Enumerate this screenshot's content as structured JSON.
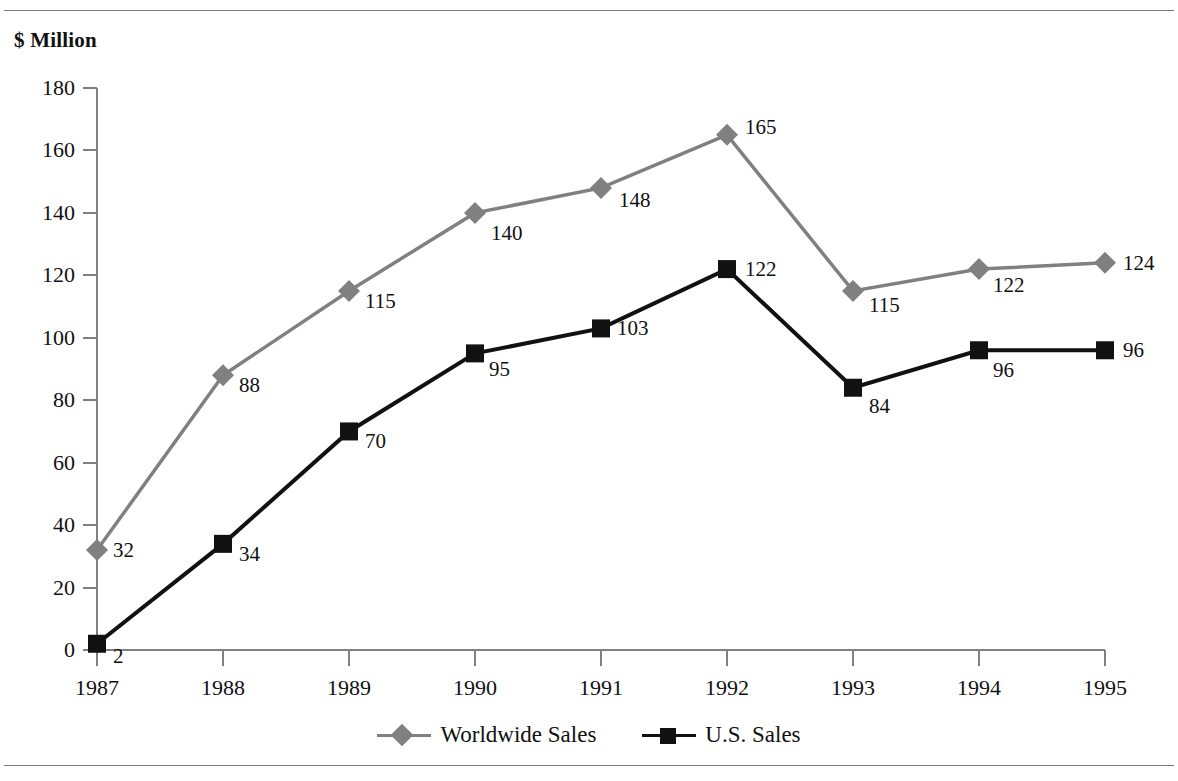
{
  "chart_data": {
    "type": "line",
    "title": "",
    "xlabel": "",
    "ylabel": "$ Million",
    "ylim": [
      0,
      180
    ],
    "ytick_labels": [
      "0",
      "20",
      "40",
      "60",
      "80",
      "100",
      "120",
      "140",
      "160",
      "180"
    ],
    "ytick_values": [
      0,
      20,
      40,
      60,
      80,
      100,
      120,
      140,
      160,
      180
    ],
    "grid": false,
    "legend_position": "bottom-center",
    "categories": [
      "1987",
      "1988",
      "1989",
      "1990",
      "1991",
      "1992",
      "1993",
      "1994",
      "1995"
    ],
    "series": [
      {
        "name": "Worldwide Sales",
        "values": [
          32,
          88,
          115,
          140,
          148,
          165,
          115,
          122,
          124
        ],
        "color": "#808080",
        "marker": "diamond"
      },
      {
        "name": "U.S. Sales",
        "values": [
          2,
          34,
          70,
          95,
          103,
          122,
          84,
          96,
          96
        ],
        "color": "#111111",
        "marker": "square"
      }
    ],
    "point_labels": {
      "Worldwide Sales": [
        "32",
        "88",
        "115",
        "140",
        "148",
        "165",
        "115",
        "122",
        "124"
      ],
      "U.S. Sales": [
        "2",
        "34",
        "70",
        "95",
        "103",
        "122",
        "84",
        "96",
        "96"
      ]
    }
  },
  "axis": {
    "unit_label": "$ Million"
  },
  "legend": {
    "entries": [
      {
        "label": "Worldwide Sales",
        "marker_name": "diamond-marker-icon"
      },
      {
        "label": "U.S. Sales",
        "marker_name": "square-marker-icon"
      }
    ]
  },
  "colors": {
    "worldwide": "#808080",
    "us": "#111111",
    "axis": "#808080",
    "rule": "#7a7a7a",
    "text": "#111111"
  }
}
